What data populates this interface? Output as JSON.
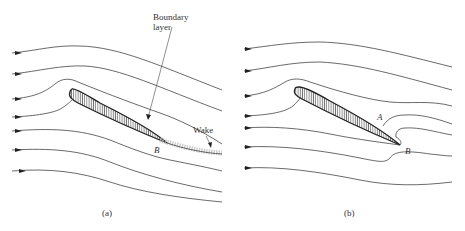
{
  "figure": {
    "panels": [
      {
        "id": "a",
        "caption": "(a)",
        "annotations": {
          "boundary_layer_line1": "Boundary",
          "boundary_layer_line2": "layer",
          "wake": "Wake",
          "point_b": "B"
        }
      },
      {
        "id": "b",
        "caption": "(b)",
        "annotations": {
          "point_a": "A",
          "point_b": "B"
        }
      }
    ],
    "colors": {
      "line": "#2a2a2a",
      "hatch": "#3a3a3a",
      "wake": "#b8b8b8",
      "text": "#333333"
    }
  }
}
